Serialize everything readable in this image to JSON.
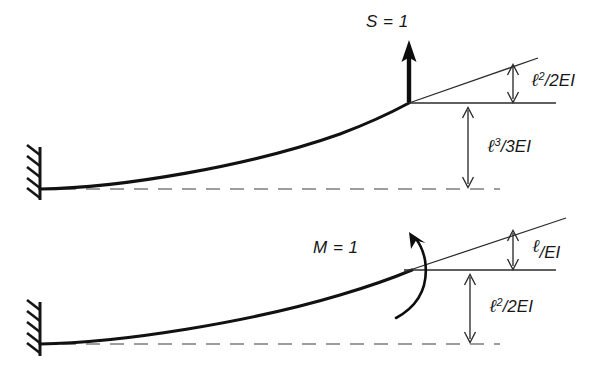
{
  "figure": {
    "background_color": "#ffffff",
    "ink_color": "#111111",
    "dashed_line_color": "#7d7d7d"
  },
  "panels": [
    {
      "id": "upper",
      "name": "unit-shear-panel",
      "load_label": "S = 1",
      "load_type": "point-force-upward",
      "support": "fixed-wall-hatched",
      "rotation_label": {
        "text": "ℓ²/2EI",
        "base": "ℓ",
        "exponent": "2",
        "denominator": "/2EI",
        "meaning": "end rotation"
      },
      "deflection_label": {
        "text": "ℓ³/3EI",
        "base": "ℓ",
        "exponent": "3",
        "denominator": "/3EI",
        "meaning": "end deflection"
      }
    },
    {
      "id": "lower",
      "name": "unit-moment-panel",
      "load_label": "M = 1",
      "load_type": "couple-counterclockwise",
      "support": "fixed-wall-hatched",
      "rotation_label": {
        "text": "ℓ/EI",
        "base": "ℓ",
        "exponent": "",
        "denominator": "/EI",
        "meaning": "end rotation"
      },
      "deflection_label": {
        "text": "ℓ²/2EI",
        "base": "ℓ",
        "exponent": "2",
        "denominator": "/2EI",
        "meaning": "end deflection"
      }
    }
  ]
}
